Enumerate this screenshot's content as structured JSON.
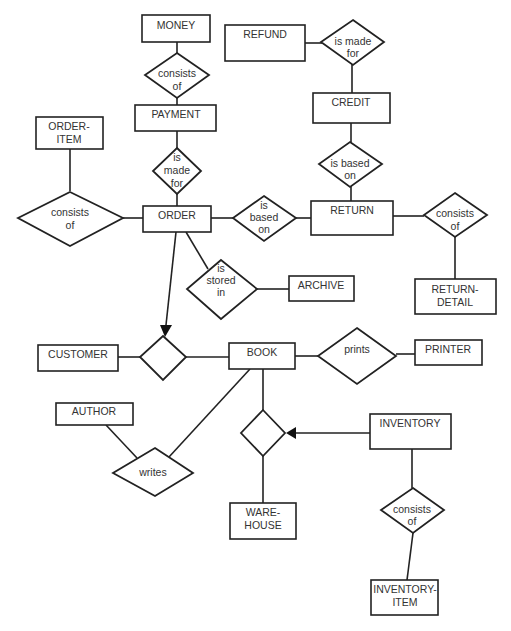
{
  "diagram": {
    "type": "entity-relationship",
    "entities": {
      "money": {
        "label": [
          "MONEY"
        ]
      },
      "payment": {
        "label": [
          "PAYMENT"
        ]
      },
      "order_item": {
        "label": [
          "ORDER-",
          "ITEM"
        ]
      },
      "order": {
        "label": [
          "ORDER"
        ]
      },
      "refund": {
        "label": [
          "REFUND"
        ]
      },
      "credit": {
        "label": [
          "CREDIT"
        ]
      },
      "return": {
        "label": [
          "RETURN"
        ]
      },
      "return_detail": {
        "label": [
          "RETURN-",
          "DETAIL"
        ]
      },
      "archive": {
        "label": [
          "ARCHIVE"
        ]
      },
      "customer": {
        "label": [
          "CUSTOMER"
        ]
      },
      "book": {
        "label": [
          "BOOK"
        ]
      },
      "printer": {
        "label": [
          "PRINTER"
        ]
      },
      "author": {
        "label": [
          "AUTHOR"
        ]
      },
      "inventory": {
        "label": [
          "INVENTORY"
        ]
      },
      "warehouse": {
        "label": [
          "WARE-",
          "HOUSE"
        ]
      },
      "inventory_item": {
        "label": [
          "INVENTORY-",
          "ITEM"
        ]
      }
    },
    "relationships": {
      "money_payment": {
        "label": [
          "consists",
          "of"
        ]
      },
      "payment_order": {
        "label": [
          "is",
          "made",
          "for"
        ]
      },
      "orderitem_order": {
        "label": [
          "consists",
          "of"
        ]
      },
      "order_return": {
        "label": [
          "is",
          "based",
          "on"
        ]
      },
      "return_detail_rel": {
        "label": [
          "consists",
          "of"
        ]
      },
      "order_archive": {
        "label": [
          "is",
          "stored",
          "in"
        ]
      },
      "refund_credit": {
        "label": [
          "is made",
          "for"
        ]
      },
      "credit_return": {
        "label": [
          "is based",
          "on"
        ]
      },
      "customer_book": {
        "label": []
      },
      "book_printer": {
        "label": [
          "prints"
        ]
      },
      "author_book": {
        "label": [
          "writes"
        ]
      },
      "book_inventory": {
        "label": []
      },
      "inventory_item_rel": {
        "label": [
          "consists",
          "of"
        ]
      }
    },
    "connections": [
      [
        "MONEY",
        "consists of",
        "PAYMENT"
      ],
      [
        "PAYMENT",
        "is made for",
        "ORDER"
      ],
      [
        "ORDER-ITEM",
        "consists of",
        "ORDER"
      ],
      [
        "ORDER",
        "is based on",
        "RETURN"
      ],
      [
        "RETURN",
        "consists of",
        "RETURN-DETAIL"
      ],
      [
        "ORDER",
        "is stored in",
        "ARCHIVE"
      ],
      [
        "REFUND",
        "is made for",
        "CREDIT"
      ],
      [
        "CREDIT",
        "is based on",
        "RETURN"
      ],
      [
        "ORDER",
        "(arrow)",
        "CUSTOMER-BOOK relationship"
      ],
      [
        "CUSTOMER",
        "(unnamed)",
        "BOOK"
      ],
      [
        "BOOK",
        "prints",
        "PRINTER"
      ],
      [
        "AUTHOR",
        "writes",
        "BOOK"
      ],
      [
        "INVENTORY",
        "(arrow)",
        "BOOK-WAREHOUSE relationship"
      ],
      [
        "BOOK",
        "(unnamed)",
        "WARE-HOUSE"
      ],
      [
        "INVENTORY",
        "consists of",
        "INVENTORY-ITEM"
      ]
    ]
  }
}
